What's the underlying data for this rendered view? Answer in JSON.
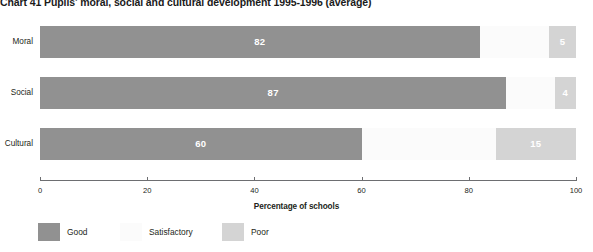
{
  "chart_data": {
    "type": "bar",
    "subtype": "stacked-horizontal",
    "title": "Chart 41 Pupils' moral, social and cultural development 1995-1996 (average)",
    "xlabel": "Percentage of schools",
    "ylabel": "",
    "xlim": [
      0,
      100
    ],
    "xticks": [
      0,
      20,
      40,
      60,
      80,
      100
    ],
    "xtick_labels": [
      "0",
      "20",
      "40",
      "60",
      "80",
      "100"
    ],
    "grid": false,
    "legend_position": "bottom-left",
    "categories": [
      "Moral",
      "Social",
      "Cultural"
    ],
    "series": [
      {
        "name": "Good",
        "color": "#919191",
        "values": [
          82,
          87,
          60
        ]
      },
      {
        "name": "Satisfactory",
        "color": "#fbfbfb",
        "values": [
          13,
          9,
          25
        ]
      },
      {
        "name": "Poor",
        "color": "#d4d4d4",
        "values": [
          5,
          4,
          15
        ]
      }
    ],
    "bars": [
      {
        "category": "Moral",
        "segments": [
          {
            "series": "Good",
            "value": 82,
            "label": "82",
            "show_label": true
          },
          {
            "series": "Satisfactory",
            "value": 13,
            "label": "",
            "show_label": false
          },
          {
            "series": "Poor",
            "value": 5,
            "label": "5",
            "show_label": true
          }
        ]
      },
      {
        "category": "Social",
        "segments": [
          {
            "series": "Good",
            "value": 87,
            "label": "87",
            "show_label": true
          },
          {
            "series": "Satisfactory",
            "value": 9,
            "label": "",
            "show_label": false
          },
          {
            "series": "Poor",
            "value": 4,
            "label": "4",
            "show_label": true
          }
        ]
      },
      {
        "category": "Cultural",
        "segments": [
          {
            "series": "Good",
            "value": 60,
            "label": "60",
            "show_label": true
          },
          {
            "series": "Satisfactory",
            "value": 25,
            "label": "",
            "show_label": false
          },
          {
            "series": "Poor",
            "value": 15,
            "label": "15",
            "show_label": true
          }
        ]
      }
    ]
  },
  "colors": {
    "good": "#919191",
    "satisfactory": "#fbfbfb",
    "poor": "#d4d4d4",
    "axis": "#6d6e71",
    "text": "#231f20",
    "value_text": "#ffffff",
    "background": "#ffffff"
  }
}
